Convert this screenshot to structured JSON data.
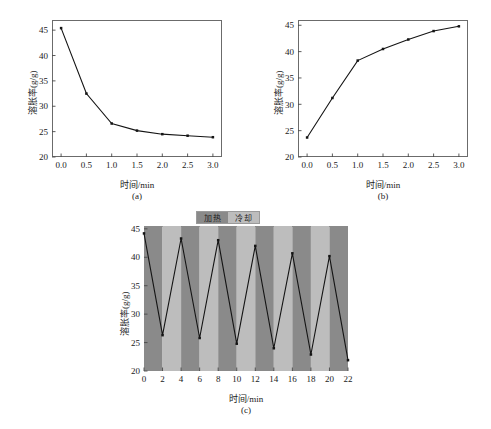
{
  "figure": {
    "background": "#ffffff",
    "line_color": "#141414",
    "marker_color": "#141414",
    "axis_color": "#6b6b6b"
  },
  "panels": [
    {
      "id": "a",
      "caption": "(a)",
      "xlabel": "时间/min",
      "ylabel": "溶胀率(g/g)",
      "xticks": [
        "0.0",
        "0.5",
        "1.0",
        "1.5",
        "2.0",
        "2.5",
        "3.0"
      ],
      "yticks": [
        "20",
        "25",
        "30",
        "35",
        "40",
        "45"
      ]
    },
    {
      "id": "b",
      "caption": "(b)",
      "xlabel": "时间/min",
      "ylabel": "溶胀率(g/g)",
      "xticks": [
        "0.0",
        "0.5",
        "1.0",
        "1.5",
        "2.0",
        "2.5",
        "3.0"
      ],
      "yticks": [
        "20",
        "25",
        "30",
        "35",
        "40",
        "45"
      ]
    },
    {
      "id": "c",
      "caption": "(c)",
      "xlabel": "时间/min",
      "ylabel": "溶胀率(g/g)",
      "xticks": [
        "0",
        "2",
        "4",
        "6",
        "8",
        "10",
        "12",
        "14",
        "16",
        "18",
        "20",
        "22"
      ],
      "yticks": [
        "20",
        "25",
        "30",
        "35",
        "40",
        "45"
      ],
      "legend": {
        "heating_label": "加热",
        "cooling_label": "冷却",
        "heating_color": "#8a8a8a",
        "cooling_color": "#bdbdbd"
      }
    }
  ],
  "chart_data": [
    {
      "type": "line",
      "panel": "a",
      "title": "",
      "xlabel": "时间/min",
      "ylabel": "溶胀率(g/g)",
      "xlim": [
        -0.18,
        3.18
      ],
      "ylim": [
        20,
        47
      ],
      "xticks": [
        0.0,
        0.5,
        1.0,
        1.5,
        2.0,
        2.5,
        3.0
      ],
      "yticks": [
        20,
        25,
        30,
        35,
        40,
        45
      ],
      "grid": false,
      "legend": "none",
      "marker": "square",
      "x": [
        0.0,
        0.5,
        1.0,
        1.5,
        2.0,
        2.5,
        3.0
      ],
      "y": [
        45.4,
        32.5,
        26.6,
        25.2,
        24.5,
        24.2,
        23.9
      ]
    },
    {
      "type": "line",
      "panel": "b",
      "title": "",
      "xlabel": "时间/min",
      "ylabel": "溶胀率(g/g)",
      "xlim": [
        -0.18,
        3.18
      ],
      "ylim": [
        20,
        46
      ],
      "xticks": [
        0.0,
        0.5,
        1.0,
        1.5,
        2.0,
        2.5,
        3.0
      ],
      "yticks": [
        20,
        25,
        30,
        35,
        40,
        45
      ],
      "grid": false,
      "legend": "none",
      "marker": "square",
      "x": [
        0.0,
        0.5,
        1.0,
        1.5,
        2.0,
        2.5,
        3.0
      ],
      "y": [
        23.7,
        31.2,
        38.3,
        40.5,
        42.3,
        43.9,
        44.8
      ]
    },
    {
      "type": "line",
      "panel": "c",
      "title": "",
      "xlabel": "时间/min",
      "ylabel": "溶胀率(g/g)",
      "xlim": [
        0,
        22
      ],
      "ylim": [
        20,
        45.5
      ],
      "xticks": [
        0,
        2,
        4,
        6,
        8,
        10,
        12,
        14,
        16,
        18,
        20,
        22
      ],
      "yticks": [
        20,
        25,
        30,
        35,
        40,
        45
      ],
      "grid": false,
      "legend": "top",
      "marker": "square",
      "x": [
        0,
        2,
        4,
        6,
        8,
        10,
        12,
        14,
        16,
        18,
        20,
        22
      ],
      "y": [
        44.2,
        26.3,
        43.3,
        25.8,
        43.0,
        24.8,
        42.0,
        24.0,
        40.7,
        22.9,
        40.2,
        21.9
      ],
      "bands": [
        {
          "x0": 0,
          "x1": 2,
          "state": "加热",
          "color": "#8a8a8a"
        },
        {
          "x0": 2,
          "x1": 4,
          "state": "冷却",
          "color": "#bdbdbd"
        },
        {
          "x0": 4,
          "x1": 6,
          "state": "加热",
          "color": "#8a8a8a"
        },
        {
          "x0": 6,
          "x1": 8,
          "state": "冷却",
          "color": "#bdbdbd"
        },
        {
          "x0": 8,
          "x1": 10,
          "state": "加热",
          "color": "#8a8a8a"
        },
        {
          "x0": 10,
          "x1": 12,
          "state": "冷却",
          "color": "#bdbdbd"
        },
        {
          "x0": 12,
          "x1": 14,
          "state": "加热",
          "color": "#8a8a8a"
        },
        {
          "x0": 14,
          "x1": 16,
          "state": "冷却",
          "color": "#bdbdbd"
        },
        {
          "x0": 16,
          "x1": 18,
          "state": "加热",
          "color": "#8a8a8a"
        },
        {
          "x0": 18,
          "x1": 20,
          "state": "冷却",
          "color": "#bdbdbd"
        },
        {
          "x0": 20,
          "x1": 22,
          "state": "加热",
          "color": "#8a8a8a"
        }
      ]
    }
  ]
}
